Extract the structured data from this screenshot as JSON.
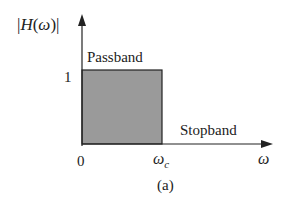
{
  "figure": {
    "y_axis_label_prefix": "|",
    "y_axis_label_H": "H",
    "y_axis_label_open": "(",
    "y_axis_label_omega": "ω",
    "y_axis_label_close": ")",
    "y_axis_label_suffix": "|",
    "y_tick_one": "1",
    "x_tick_zero": "0",
    "x_tick_cutoff_omega": "ω",
    "x_tick_cutoff_sub": "c",
    "x_axis_label": "ω",
    "passband_label": "Passband",
    "stopband_label": "Stopband",
    "caption": "(a)",
    "colors": {
      "fill": "#9a9a9a",
      "stroke": "#222222"
    }
  }
}
